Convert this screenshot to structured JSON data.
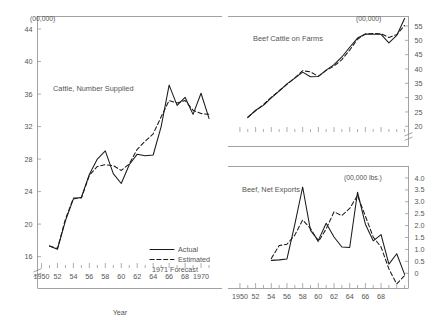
{
  "figure": {
    "xlabel": "Year",
    "legend": {
      "actual": "Actual",
      "estimated": "Estimated",
      "forecast": "1971 Forecast"
    }
  },
  "chart_data": [
    {
      "type": "line",
      "title": "Cattle, Number Supplied",
      "unit": "(00,000)",
      "panel": "left",
      "xlabel": "Year",
      "ylabel": "",
      "xlim": [
        1949.5,
        1971.5
      ],
      "ylim": [
        14.6,
        45.6
      ],
      "grid": false,
      "legend_position": "bottom-right",
      "yticks": [
        16,
        20,
        24,
        28,
        32,
        36,
        40,
        44
      ],
      "ytick_labels": [
        "16",
        "20",
        "24",
        "28",
        "32",
        "36",
        "40",
        "44"
      ],
      "xticks": [
        1950,
        1952,
        1954,
        1956,
        1958,
        1960,
        1962,
        1964,
        1966,
        1968,
        1970
      ],
      "xtick_labels": [
        "1950",
        "52",
        "54",
        "56",
        "58",
        "60",
        "62",
        "64",
        "66",
        "68",
        "1970"
      ],
      "axis_break": true,
      "x": [
        1951,
        1952,
        1953,
        1954,
        1955,
        1956,
        1957,
        1958,
        1959,
        1960,
        1961,
        1962,
        1963,
        1964,
        1965,
        1966,
        1967,
        1968,
        1969,
        1970,
        1971
      ],
      "series": [
        {
          "name": "Actual",
          "style": "solid",
          "values": [
            17.3,
            16.9,
            20.4,
            23.1,
            23.3,
            26.1,
            28.0,
            29.0,
            26.2,
            25.0,
            27.3,
            28.6,
            28.4,
            28.5,
            32.0,
            37.1,
            34.6,
            35.6,
            33.5,
            36.1,
            33.0
          ]
        },
        {
          "name": "Estimated",
          "style": "dashed",
          "values": [
            17.3,
            17.0,
            20.6,
            23.2,
            23.2,
            26.0,
            27.1,
            27.3,
            27.2,
            26.6,
            27.4,
            29.2,
            30.2,
            31.1,
            33.2,
            35.2,
            34.9,
            35.2,
            34.0,
            33.6,
            33.5
          ]
        }
      ],
      "forecast_point": {
        "x": 1971,
        "actual": 35.3,
        "estimated": 33.6
      }
    },
    {
      "type": "line",
      "title": "Beef Cattle on Farms",
      "unit": "(00,000)",
      "panel": "top-right",
      "xlabel": "Year",
      "xlim": [
        1949.5,
        1971.5
      ],
      "ylim": [
        18.0,
        58.5
      ],
      "grid": false,
      "yticks": [
        20,
        25,
        30,
        35,
        40,
        45,
        50,
        55
      ],
      "ytick_labels": [
        "20",
        "25",
        "30",
        "35",
        "40",
        "45",
        "50",
        "55"
      ],
      "xticks": [
        1950,
        1952,
        1954,
        1956,
        1958,
        1960,
        1962,
        1964,
        1966,
        1968
      ],
      "xtick_labels": [
        "1950",
        "52",
        "54",
        "56",
        "58",
        "60",
        "62",
        "64",
        "66",
        "68"
      ],
      "axis_break": true,
      "x": [
        1951,
        1952,
        1953,
        1954,
        1955,
        1956,
        1957,
        1958,
        1959,
        1960,
        1961,
        1962,
        1963,
        1964,
        1965,
        1966,
        1967,
        1968,
        1969,
        1970,
        1971
      ],
      "series": [
        {
          "name": "Actual",
          "style": "solid",
          "values": [
            23.0,
            25.6,
            27.3,
            29.9,
            32.3,
            34.8,
            36.8,
            38.9,
            37.3,
            37.4,
            39.6,
            41.5,
            44.2,
            47.6,
            50.8,
            52.2,
            52.1,
            52.1,
            49.1,
            51.7,
            57.6
          ]
        },
        {
          "name": "Estimated",
          "style": "dashed",
          "values": [
            23.2,
            25.4,
            27.6,
            30.1,
            32.4,
            34.6,
            36.9,
            39.4,
            39.0,
            37.4,
            39.5,
            41.0,
            43.3,
            46.6,
            50.4,
            52.2,
            52.4,
            52.3,
            51.0,
            52.0,
            55.2
          ]
        }
      ]
    },
    {
      "type": "line",
      "title": "Beef, Net Exports",
      "unit": "(00,000 lbs.)",
      "panel": "bottom-right",
      "xlabel": "Year",
      "xlim": [
        1949.5,
        1971.5
      ],
      "ylim": [
        -0.62,
        4.25
      ],
      "grid": false,
      "yticks": [
        0,
        0.5,
        1.0,
        1.5,
        2.0,
        2.5,
        3.0,
        3.5,
        4.0
      ],
      "ytick_labels": [
        "0",
        "0.5",
        "1.0",
        "1.5",
        "2.0",
        "2.5",
        "3.0",
        "3.5",
        "4.0"
      ],
      "xticks": [
        1950,
        1952,
        1954,
        1956,
        1958,
        1960,
        1962,
        1964,
        1966,
        1968
      ],
      "xtick_labels": [
        "1950",
        "52",
        "54",
        "56",
        "58",
        "60",
        "62",
        "64",
        "66",
        "68"
      ],
      "x": [
        1954,
        1955,
        1956,
        1957,
        1958,
        1959,
        1960,
        1961,
        1962,
        1963,
        1964,
        1965,
        1966,
        1967,
        1968,
        1969,
        1970,
        1971
      ],
      "series": [
        {
          "name": "Actual",
          "style": "solid",
          "values": [
            0.54,
            0.56,
            0.6,
            2.05,
            3.62,
            1.8,
            1.38,
            2.1,
            1.52,
            1.1,
            1.08,
            3.4,
            2.06,
            1.36,
            1.62,
            0.38,
            0.82,
            -0.05
          ]
        },
        {
          "name": "Estimated",
          "style": "dashed",
          "values": [
            0.62,
            1.16,
            1.22,
            1.6,
            2.24,
            1.88,
            1.32,
            1.86,
            2.58,
            2.42,
            2.72,
            3.26,
            2.4,
            1.52,
            1.1,
            0.18,
            -0.45,
            -0.1
          ]
        }
      ]
    }
  ]
}
